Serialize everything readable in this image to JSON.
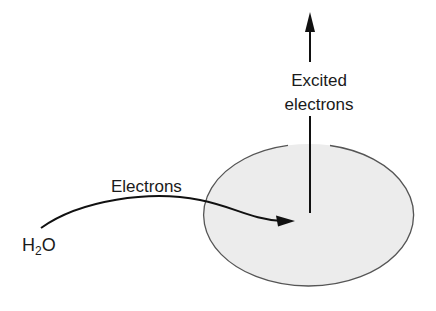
{
  "diagram": {
    "title": "",
    "nodes": [
      {
        "id": "h2o",
        "label_main": "H",
        "label_sub": "2",
        "label_tail": "O",
        "full_label": "H2O"
      },
      {
        "id": "center",
        "shape": "ellipse",
        "fill": "#ececec",
        "stroke": "#555555"
      }
    ],
    "edges": [
      {
        "from": "h2o",
        "to": "center",
        "label": "Electrons",
        "style": "curved-arrow"
      },
      {
        "from": "center",
        "to": "up",
        "label_line1": "Excited",
        "label_line2": "electrons",
        "style": "vertical-arrow"
      }
    ],
    "colors": {
      "ellipse_fill": "#ececec",
      "ellipse_stroke": "#555555",
      "arrow": "#111111",
      "text": "#1a1a1a"
    }
  }
}
